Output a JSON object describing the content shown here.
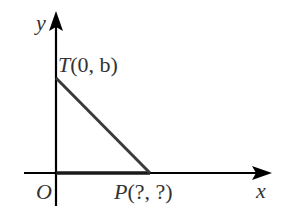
{
  "diagram": {
    "type": "coordinate-geometry",
    "axes": {
      "x_label": "x",
      "y_label": "y",
      "origin_label": "O"
    },
    "points": {
      "T": {
        "name": "T",
        "coords_text": "(0, b)",
        "px": [
          56,
          77
        ]
      },
      "P": {
        "name": "P",
        "coords_text": "(?, ?)",
        "px": [
          150,
          173
        ]
      }
    },
    "segments": [
      {
        "from": "T",
        "to": "P"
      },
      {
        "from": "O",
        "to": "P"
      }
    ],
    "colors": {
      "axis": "#000000",
      "segment": "#3a3a3a",
      "label": "#333333"
    }
  }
}
